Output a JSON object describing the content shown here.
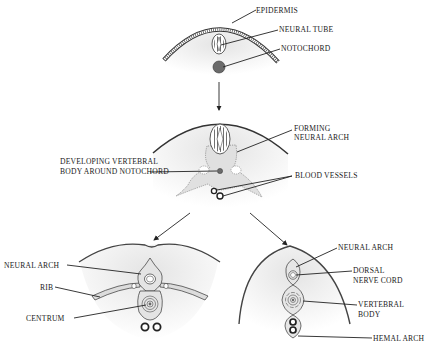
{
  "diagram": {
    "stages": [
      {
        "id": "stage-1",
        "labels": {
          "epidermis": "EPIDERMIS",
          "neural_tube": "NEURAL TUBE",
          "notochord": "NOTOCHORD"
        }
      },
      {
        "id": "stage-2",
        "labels": {
          "forming_1": "FORMING",
          "forming_2": "NEURAL ARCH",
          "dev_1": "DEVELOPING VERTEBRAL",
          "dev_2": "BODY AROUND NOTOCHORD",
          "blood": "BLOOD VESSELS"
        }
      },
      {
        "id": "stage-3-left",
        "labels": {
          "neural_arch": "NEURAL ARCH",
          "rib": "RIB",
          "centrum": "CENTRUM"
        }
      },
      {
        "id": "stage-3-right",
        "labels": {
          "neural_arch": "NEURAL ARCH",
          "dorsal_1": "DORSAL",
          "dorsal_2": "NERVE CORD",
          "vert_1": "VERTEBRAL",
          "vert_2": "BODY",
          "hemal": "HEMAL ARCH"
        }
      }
    ],
    "colors": {
      "tissue": "#e9e9e9",
      "line": "#222222",
      "notochord": "#6a6a6a"
    }
  }
}
